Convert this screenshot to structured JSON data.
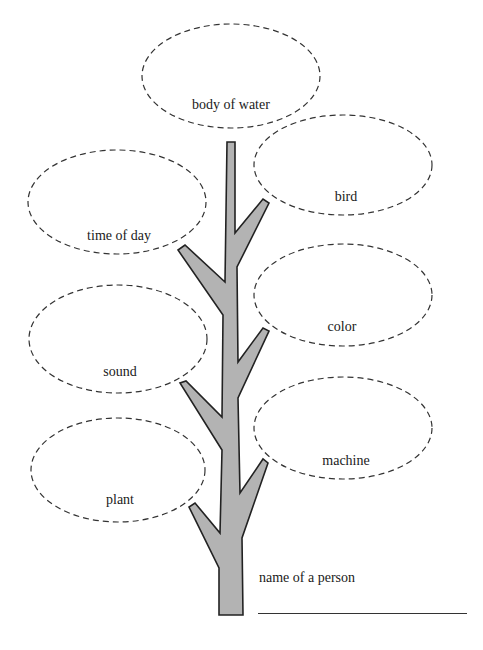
{
  "diagram": {
    "type": "word-tree worksheet",
    "colors": {
      "trunk_fill": "#b3b3b3",
      "trunk_stroke": "#222222",
      "ellipse_stroke": "#333333",
      "text": "#1a1a1a"
    },
    "bubbles": [
      {
        "id": "body-of-water",
        "label": "body of water",
        "cx": 231,
        "cy": 76,
        "rx": 89,
        "ry": 52,
        "label_x": 231,
        "label_y": 98
      },
      {
        "id": "bird",
        "label": "bird",
        "cx": 343,
        "cy": 165,
        "rx": 89,
        "ry": 50,
        "label_x": 346,
        "label_y": 190
      },
      {
        "id": "time-of-day",
        "label": "time of day",
        "cx": 117,
        "cy": 202,
        "rx": 89,
        "ry": 52,
        "label_x": 119,
        "label_y": 229
      },
      {
        "id": "color",
        "label": "color",
        "cx": 343,
        "cy": 295,
        "rx": 89,
        "ry": 51,
        "label_x": 342,
        "label_y": 320
      },
      {
        "id": "sound",
        "label": "sound",
        "cx": 118,
        "cy": 339,
        "rx": 89,
        "ry": 54,
        "label_x": 120,
        "label_y": 365
      },
      {
        "id": "machine",
        "label": "machine",
        "cx": 343,
        "cy": 428,
        "rx": 89,
        "ry": 51,
        "label_x": 346,
        "label_y": 454
      },
      {
        "id": "plant",
        "label": "plant",
        "cx": 118,
        "cy": 470,
        "rx": 87,
        "ry": 52,
        "label_x": 120,
        "label_y": 493
      }
    ],
    "bottom_prompt": {
      "label": "name of a person",
      "label_x": 259,
      "label_y": 571,
      "line_x1": 258,
      "line_x2": 467,
      "line_y": 613
    }
  }
}
